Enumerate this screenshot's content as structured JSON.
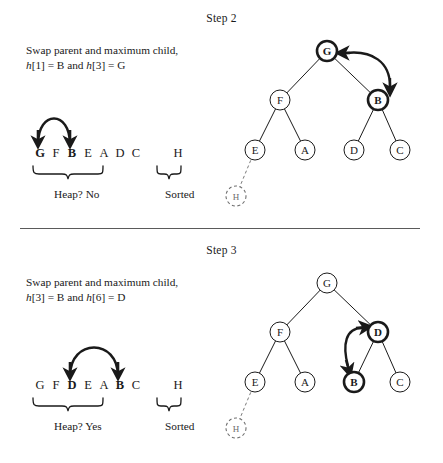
{
  "figure": {
    "kind": "heap-sort-diagram",
    "divider": true
  },
  "steps": [
    {
      "id": "step2",
      "title": "Step 2",
      "caption_line1": "Swap parent and maximum child,",
      "caption_h1": "h",
      "caption_idx1": "[1] = B and ",
      "caption_h2": "h",
      "caption_idx2": "[3] = G",
      "array": {
        "heap_letters": [
          "G",
          "F",
          "B",
          "E",
          "A",
          "D",
          "C"
        ],
        "heap_bold": [
          true,
          false,
          true,
          false,
          false,
          false,
          false
        ],
        "sorted_letters": [
          "H"
        ],
        "heap_label": "Heap?  No",
        "sorted_label": "Sorted",
        "arrow_from_index": 0,
        "arrow_to_index": 2
      },
      "tree": {
        "nodes": [
          {
            "name": "root",
            "label": "G",
            "cx": 105,
            "cy": 23,
            "r": 10,
            "bold": true,
            "dashed": false
          },
          {
            "name": "left-child",
            "label": "F",
            "cx": 58,
            "cy": 72,
            "r": 10,
            "bold": false,
            "dashed": false
          },
          {
            "name": "right-child",
            "label": "B",
            "cx": 156,
            "cy": 72,
            "r": 10,
            "bold": true,
            "dashed": false
          },
          {
            "name": "leaf-e",
            "label": "E",
            "cx": 33,
            "cy": 122,
            "r": 10,
            "bold": false,
            "dashed": false
          },
          {
            "name": "leaf-a",
            "label": "A",
            "cx": 83,
            "cy": 122,
            "r": 10,
            "bold": false,
            "dashed": false
          },
          {
            "name": "leaf-d",
            "label": "D",
            "cx": 132,
            "cy": 122,
            "r": 10,
            "bold": false,
            "dashed": false
          },
          {
            "name": "leaf-c",
            "label": "C",
            "cx": 178,
            "cy": 122,
            "r": 10,
            "bold": false,
            "dashed": false
          },
          {
            "name": "leaf-h-removed",
            "label": "H",
            "cx": 14,
            "cy": 168,
            "r": 10,
            "bold": false,
            "dashed": true
          }
        ],
        "swap_arrow": {
          "from": "G",
          "to": "B",
          "side": "right"
        }
      }
    },
    {
      "id": "step3",
      "title": "Step 3",
      "caption_line1": "Swap parent and maximum child,",
      "caption_h1": "h",
      "caption_idx1": "[3] = B and ",
      "caption_h2": "h",
      "caption_idx2": "[6] = D",
      "array": {
        "heap_letters": [
          "G",
          "F",
          "D",
          "E",
          "A",
          "B",
          "C"
        ],
        "heap_bold": [
          false,
          false,
          true,
          false,
          false,
          true,
          false
        ],
        "sorted_letters": [
          "H"
        ],
        "heap_label": "Heap?  Yes",
        "sorted_label": "Sorted",
        "arrow_from_index": 2,
        "arrow_to_index": 5
      },
      "tree": {
        "nodes": [
          {
            "name": "root",
            "label": "G",
            "cx": 105,
            "cy": 23,
            "r": 10,
            "bold": false,
            "dashed": false
          },
          {
            "name": "left-child",
            "label": "F",
            "cx": 58,
            "cy": 72,
            "r": 10,
            "bold": false,
            "dashed": false
          },
          {
            "name": "right-child",
            "label": "D",
            "cx": 156,
            "cy": 72,
            "r": 10,
            "bold": true,
            "dashed": false
          },
          {
            "name": "leaf-e",
            "label": "E",
            "cx": 33,
            "cy": 122,
            "r": 10,
            "bold": false,
            "dashed": false
          },
          {
            "name": "leaf-a",
            "label": "A",
            "cx": 83,
            "cy": 122,
            "r": 10,
            "bold": false,
            "dashed": false
          },
          {
            "name": "leaf-b",
            "label": "B",
            "cx": 132,
            "cy": 122,
            "r": 10,
            "bold": true,
            "dashed": false
          },
          {
            "name": "leaf-c",
            "label": "C",
            "cx": 178,
            "cy": 122,
            "r": 10,
            "bold": false,
            "dashed": false
          },
          {
            "name": "leaf-h-removed",
            "label": "H",
            "cx": 14,
            "cy": 168,
            "r": 10,
            "bold": false,
            "dashed": true
          }
        ],
        "swap_arrow": {
          "from": "D",
          "to": "B",
          "side": "left"
        }
      }
    }
  ],
  "colors": {
    "ink": "#1a1a1a",
    "rule": "#5a5a5a",
    "ghost": "#6d6d6d",
    "background": "#ffffff"
  }
}
